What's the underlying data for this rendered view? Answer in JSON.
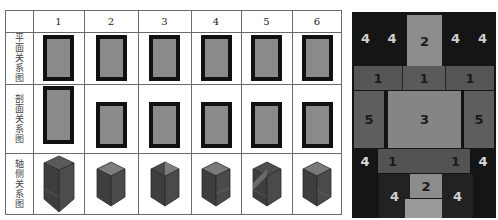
{
  "table": {
    "columns": [
      "1",
      "2",
      "3",
      "4",
      "5",
      "6"
    ],
    "rows": [
      {
        "label": "平面关系图",
        "kind": "plan"
      },
      {
        "label": "剖面关系图",
        "kind": "section"
      },
      {
        "label": "轴侧关系图",
        "kind": "axonometric"
      }
    ],
    "plan_boxes": [
      {
        "w": 38,
        "h": 46
      },
      {
        "w": 38,
        "h": 46
      },
      {
        "w": 38,
        "h": 46
      },
      {
        "w": 38,
        "h": 46
      },
      {
        "w": 38,
        "h": 46
      },
      {
        "w": 38,
        "h": 46
      }
    ],
    "section_boxes": [
      {
        "w": 38,
        "h": 58
      },
      {
        "w": 38,
        "h": 46
      },
      {
        "w": 38,
        "h": 46
      },
      {
        "w": 38,
        "h": 46
      },
      {
        "w": 38,
        "h": 46
      },
      {
        "w": 38,
        "h": 46
      }
    ]
  },
  "zone_diagram": {
    "labels": {
      "top_left_outer": "4",
      "top_left_inner": "4",
      "top_center": "2",
      "top_right_inner": "4",
      "top_right_outer": "4",
      "mid_left": "1",
      "mid_center": "1",
      "mid_right": "1",
      "core_left": "5",
      "core_center": "3",
      "core_right": "5",
      "low_left_outer": "4",
      "low_left": "1",
      "low_right": "1",
      "low_right_outer": "4",
      "bottom_left": "4",
      "bottom_center": "2",
      "bottom_right": "4"
    },
    "colors": {
      "zone_4": "#151515",
      "zone_2": "#8c8c8c",
      "zone_1": "#565656",
      "zone_3": "#858585",
      "zone_5": "#5e5e5e"
    }
  }
}
